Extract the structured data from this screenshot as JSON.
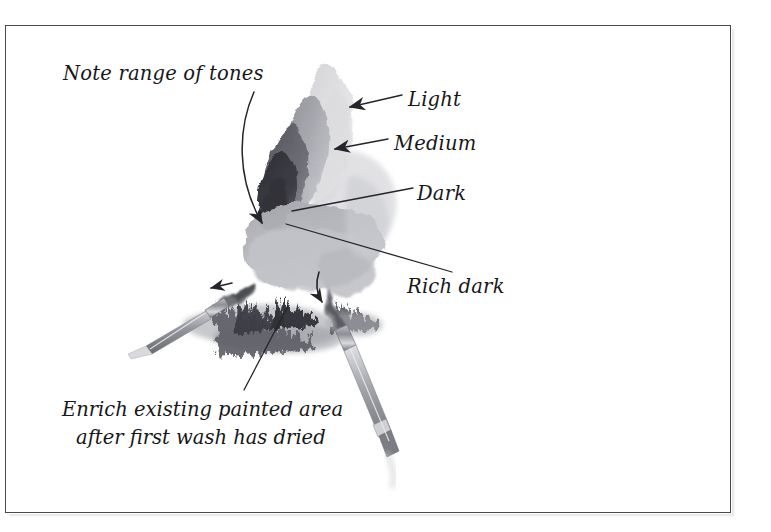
{
  "page": {
    "kind": "watercolor-technique-illustration",
    "background_color": "#ffffff",
    "border_color": "#4a4a4c"
  },
  "annotations": {
    "note_tones": "Note range of tones",
    "light": "Light",
    "medium": "Medium",
    "dark": "Dark",
    "rich_dark": "Rich dark",
    "caption_line1": "Enrich existing painted area",
    "caption_line2": "after first wash has dried"
  },
  "artwork": {
    "subject": "watercolor wash study with two paintbrushes",
    "tones": [
      {
        "name": "Light",
        "color": "#e2e2e4"
      },
      {
        "name": "Medium",
        "color": "#a9aab0"
      },
      {
        "name": "Dark",
        "color": "#6d6e76"
      },
      {
        "name": "Rich dark",
        "color": "#3a3b41"
      }
    ],
    "brushes": [
      {
        "name": "left-brush",
        "orientation": "pointing up-right"
      },
      {
        "name": "right-brush",
        "orientation": "pointing down-right"
      }
    ],
    "arrows": [
      {
        "name": "note-tones-arrow",
        "style": "curved",
        "points_to": "dark edge of wash"
      },
      {
        "name": "light-arrow",
        "style": "straight",
        "points_to": "light wash area"
      },
      {
        "name": "medium-arrow",
        "style": "straight",
        "points_to": "medium wash area"
      },
      {
        "name": "dark-leader",
        "style": "leader-line",
        "points_to": "dark wash area"
      },
      {
        "name": "rich-dark-leader",
        "style": "leader-line",
        "points_to": "richest dark wash area"
      },
      {
        "name": "left-brush-arrow",
        "style": "small straight",
        "points_to": "left"
      },
      {
        "name": "right-brush-arrow",
        "style": "small curved",
        "points_to": "down"
      },
      {
        "name": "caption-leader",
        "style": "leader-line",
        "points_to": "dark textured foliage strokes"
      }
    ]
  }
}
